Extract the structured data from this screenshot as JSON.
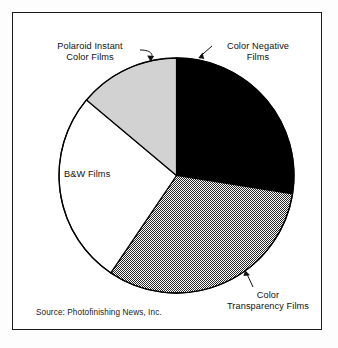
{
  "figure": {
    "source_note": "Source: Photofinishing News, Inc."
  },
  "labels": {
    "polaroid": {
      "line1": "Polaroid Instant",
      "line2": "Color Films"
    },
    "color_negative": {
      "line1": "Color Negative",
      "line2": "Films"
    },
    "bw": {
      "line1": "B&W Films",
      "line2": ""
    },
    "color_transparency": {
      "line1": "Color",
      "line2": "Transparency Films"
    }
  },
  "colors": {
    "frame": "#1b1b1b",
    "page": "#ffffff",
    "color_negative_fill": "#000000",
    "color_transparency_fill": "#9a9a9a",
    "bw_fill": "#ffffff",
    "polaroid_fill": "#d2d2d2",
    "wedge_outline": "#000000",
    "text": "#111111"
  },
  "chart_data": {
    "type": "pie",
    "title": "",
    "subtitle": "",
    "xlabel": "",
    "ylabel": "",
    "legend_position": "none",
    "labels_position": "callout",
    "grid": false,
    "units": "percent of market",
    "start_angle_deg": 0,
    "direction": "clockwise",
    "categories": [
      "Color Negative Films",
      "Color Transparency Films",
      "B&W Films",
      "Polaroid Instant Color Films"
    ],
    "values": [
      27.5,
      32.0,
      26.5,
      14.0
    ],
    "slices": [
      {
        "name": "Color Negative Films",
        "value": 27.5,
        "start_angle_deg": 0,
        "end_angle_deg": 99,
        "fill": "black",
        "fill_color": "#000000"
      },
      {
        "name": "Color Transparency Films",
        "value": 32.0,
        "start_angle_deg": 99,
        "end_angle_deg": 214,
        "fill": "hatched-gray",
        "fill_color": "#9a9a9a"
      },
      {
        "name": "B&W Films",
        "value": 26.5,
        "start_angle_deg": 214,
        "end_angle_deg": 310,
        "fill": "white",
        "fill_color": "#ffffff"
      },
      {
        "name": "Polaroid Instant Color Films",
        "value": 14.0,
        "start_angle_deg": 310,
        "end_angle_deg": 360,
        "fill": "light-gray",
        "fill_color": "#d2d2d2"
      }
    ],
    "annotations": [
      "Source: Photofinishing News, Inc."
    ]
  }
}
